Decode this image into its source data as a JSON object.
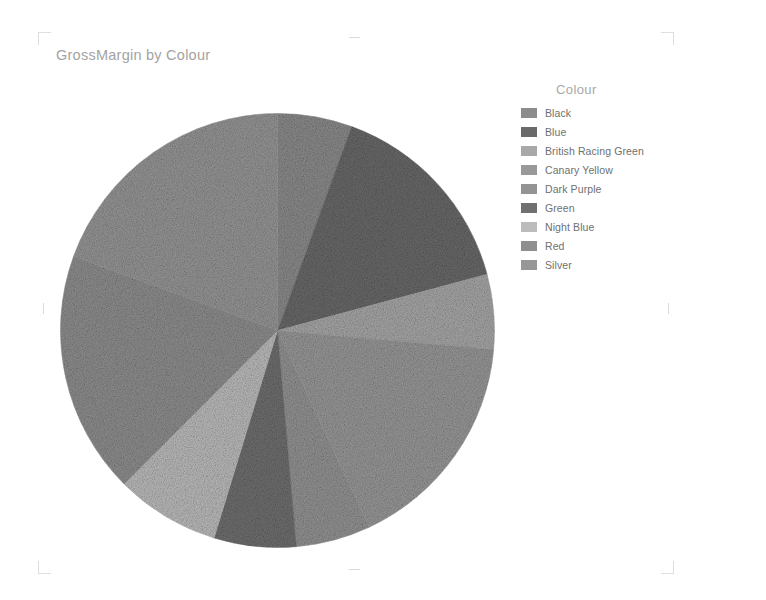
{
  "chart_title": "GrossMargin by Colour",
  "legend": {
    "title": "Colour",
    "items": [
      {
        "label": "Black",
        "color": "#8c8c8c"
      },
      {
        "label": "Blue",
        "color": "#6a6a6a"
      },
      {
        "label": "British Racing Green",
        "color": "#a8a8a8"
      },
      {
        "label": "Canary Yellow",
        "color": "#999999"
      },
      {
        "label": "Dark Purple",
        "color": "#949494"
      },
      {
        "label": "Green",
        "color": "#707070"
      },
      {
        "label": "Night Blue",
        "color": "#bcbcbc"
      },
      {
        "label": "Red",
        "color": "#8f8f8f"
      },
      {
        "label": "Silver",
        "color": "#979797"
      }
    ]
  },
  "crop_marks": {
    "top_left": "corner-bracket",
    "top_right": "corner-bracket",
    "bottom_left": "corner-bracket",
    "bottom_right": "corner-bracket",
    "top_center": "edge-tick",
    "bottom_center": "edge-tick",
    "left_center": "edge-tick",
    "right_center": "edge-tick"
  },
  "chart_data": {
    "type": "pie",
    "title": "GrossMargin by Colour",
    "legend_title": "Colour",
    "legend_position": "right",
    "grid": false,
    "xlabel": "",
    "ylabel": "GrossMargin",
    "center": {
      "x": 277,
      "y": 330
    },
    "radius": 217,
    "start_angle_deg": 0,
    "direction": "clockwise",
    "categories": [
      "Black",
      "Blue",
      "British Racing Green",
      "Canary Yellow",
      "Dark Purple",
      "Green",
      "Night Blue",
      "Red",
      "Silver"
    ],
    "values": [
      20,
      55,
      20,
      60,
      20,
      22,
      28,
      65,
      70
    ],
    "slices": [
      {
        "label": "Black",
        "value": 20,
        "percent": 5.6,
        "start_deg": 0,
        "end_deg": 20,
        "color": "#8c8c8c"
      },
      {
        "label": "Blue",
        "value": 55,
        "percent": 15.3,
        "start_deg": 20,
        "end_deg": 75,
        "color": "#6a6a6a"
      },
      {
        "label": "British Racing Green",
        "value": 20,
        "percent": 5.6,
        "start_deg": 75,
        "end_deg": 95,
        "color": "#a8a8a8"
      },
      {
        "label": "Canary Yellow",
        "value": 60,
        "percent": 16.7,
        "start_deg": 95,
        "end_deg": 155,
        "color": "#999999"
      },
      {
        "label": "Dark Purple",
        "value": 20,
        "percent": 5.6,
        "start_deg": 155,
        "end_deg": 175,
        "color": "#949494"
      },
      {
        "label": "Green",
        "value": 22,
        "percent": 6.1,
        "start_deg": 175,
        "end_deg": 197,
        "color": "#707070"
      },
      {
        "label": "Night Blue",
        "value": 28,
        "percent": 7.8,
        "start_deg": 197,
        "end_deg": 225,
        "color": "#bcbcbc"
      },
      {
        "label": "Red",
        "value": 65,
        "percent": 18.1,
        "start_deg": 225,
        "end_deg": 290,
        "color": "#8f8f8f"
      },
      {
        "label": "Silver",
        "value": 70,
        "percent": 19.4,
        "start_deg": 290,
        "end_deg": 360,
        "color": "#979797"
      }
    ]
  }
}
